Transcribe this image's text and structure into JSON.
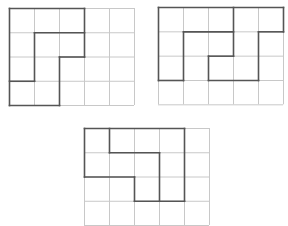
{
  "colors": {
    "grid": "#c8c8c8",
    "outline": "#555555",
    "background": "#ffffff"
  },
  "puzzles": [
    {
      "name": "grid-top-left",
      "origin": [
        9,
        8
      ],
      "cell": [
        25,
        24.25
      ],
      "cols": 5,
      "rows": 4,
      "bold_segments": [
        [
          0,
          0,
          3,
          0
        ],
        [
          0,
          0,
          0,
          4
        ],
        [
          3,
          0,
          3,
          2
        ],
        [
          1,
          1,
          3,
          1
        ],
        [
          1,
          1,
          1,
          3
        ],
        [
          0,
          3,
          1,
          3
        ],
        [
          2,
          2,
          3,
          2
        ],
        [
          2,
          2,
          2,
          4
        ],
        [
          0,
          4,
          2,
          4
        ]
      ]
    },
    {
      "name": "grid-top-right",
      "origin": [
        158,
        7
      ],
      "cell": [
        25,
        24.33
      ],
      "cols": 5,
      "rows": 4,
      "bold_segments": [
        [
          0,
          0,
          5,
          0
        ],
        [
          0,
          0,
          0,
          3
        ],
        [
          5,
          0,
          5,
          1
        ],
        [
          4,
          1,
          5,
          1
        ],
        [
          4,
          1,
          4,
          3
        ],
        [
          0,
          3,
          1,
          3
        ],
        [
          2,
          3,
          4,
          3
        ],
        [
          1,
          1,
          1,
          3
        ],
        [
          1,
          1,
          3,
          1
        ],
        [
          3,
          0,
          3,
          2
        ],
        [
          2,
          2,
          3,
          2
        ],
        [
          2,
          2,
          2,
          3
        ]
      ]
    },
    {
      "name": "grid-bottom",
      "origin": [
        84,
        128
      ],
      "cell": [
        25,
        24.25
      ],
      "cols": 5,
      "rows": 4,
      "bold_segments": [
        [
          0,
          0,
          4,
          0
        ],
        [
          0,
          0,
          0,
          2
        ],
        [
          0,
          2,
          2,
          2
        ],
        [
          2,
          2,
          2,
          3
        ],
        [
          2,
          3,
          4,
          3
        ],
        [
          4,
          0,
          4,
          3
        ],
        [
          1,
          0,
          1,
          1
        ],
        [
          1,
          1,
          3,
          1
        ],
        [
          3,
          1,
          3,
          3
        ]
      ]
    }
  ]
}
